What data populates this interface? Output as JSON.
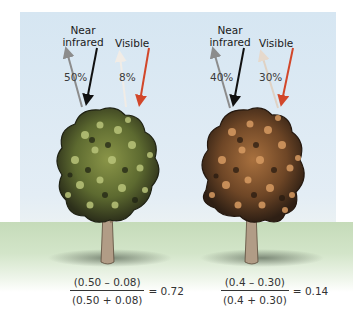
{
  "colors": {
    "sky": "#d9e7f3",
    "ground": "#c9ddbd",
    "near_infrared_reflected_arrow": "#8c8c8c",
    "near_infrared_incoming_arrow": "#111111",
    "visible_reflected_arrow": "#e8ddd3",
    "visible_incoming_arrow": "#d2472a",
    "healthy_canopy": "#6f7a3a",
    "stressed_canopy": "#7b5230"
  },
  "trees": [
    {
      "id": "healthy",
      "near_infrared_label": "Near\ninfrared",
      "near_infrared_line1": "Near",
      "near_infrared_line2": "infrared",
      "visible_label": "Visible",
      "near_infrared_reflectance": "50%",
      "visible_reflectance": "8%",
      "formula": {
        "numerator": "(0.50 – 0.08)",
        "denominator": "(0.50 + 0.08)",
        "result": "= 0.72"
      }
    },
    {
      "id": "stressed",
      "near_infrared_line1": "Near",
      "near_infrared_line2": "infrared",
      "visible_label": "Visible",
      "near_infrared_reflectance": "40%",
      "visible_reflectance": "30%",
      "formula": {
        "numerator": "(0.4 – 0.30)",
        "denominator": "(0.4 + 0.30)",
        "result": "= 0.14"
      }
    }
  ]
}
